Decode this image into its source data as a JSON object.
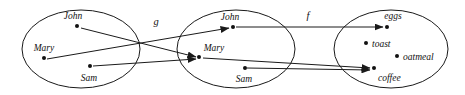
{
  "figure": {
    "background_color": "#ffffff",
    "stroke_color": "#1a1a1a",
    "width": 465,
    "height": 95
  },
  "sets": [
    {
      "id": "domain",
      "cx": 81,
      "cy": 49,
      "rx": 59,
      "ry": 39,
      "elements": [
        {
          "name": "John",
          "dot_x": 77,
          "dot_y": 26,
          "label_x": 73,
          "label_y": 19,
          "anchor": "middle"
        },
        {
          "name": "Mary",
          "dot_x": 44,
          "dot_y": 58,
          "label_x": 44,
          "label_y": 51,
          "anchor": "middle"
        },
        {
          "name": "Sam",
          "dot_x": 90,
          "dot_y": 66,
          "label_x": 89,
          "label_y": 81,
          "anchor": "middle"
        }
      ]
    },
    {
      "id": "middle",
      "cx": 236,
      "cy": 49,
      "rx": 59,
      "ry": 39,
      "elements": [
        {
          "name": "John",
          "dot_x": 233,
          "dot_y": 27,
          "label_x": 230,
          "label_y": 20,
          "anchor": "middle"
        },
        {
          "name": "Mary",
          "dot_x": 199,
          "dot_y": 57,
          "label_x": 214,
          "label_y": 51,
          "anchor": "middle"
        },
        {
          "name": "Sam",
          "dot_x": 245,
          "dot_y": 68,
          "label_x": 244,
          "label_y": 82,
          "anchor": "middle"
        }
      ]
    },
    {
      "id": "codomain",
      "cx": 391,
      "cy": 49,
      "rx": 57,
      "ry": 39,
      "elements": [
        {
          "name": "eggs",
          "dot_x": 387,
          "dot_y": 27,
          "label_x": 393,
          "label_y": 19,
          "anchor": "middle"
        },
        {
          "name": "toast",
          "dot_x": 366,
          "dot_y": 43,
          "label_x": 372,
          "label_y": 47,
          "anchor": "start"
        },
        {
          "name": "oatmeal",
          "dot_x": 397,
          "dot_y": 56,
          "label_x": 403,
          "label_y": 60,
          "anchor": "start"
        },
        {
          "name": "coffee",
          "dot_x": 374,
          "dot_y": 68,
          "label_x": 378,
          "label_y": 81,
          "anchor": "start"
        }
      ]
    }
  ],
  "maps": [
    {
      "name": "g",
      "label_x": 156,
      "label_y": 25
    },
    {
      "name": "f",
      "label_x": 308,
      "label_y": 19
    }
  ],
  "arrows": [
    {
      "from": "John(domain)",
      "to": "Mary(middle)",
      "x1": 81,
      "y1": 28,
      "x2": 196,
      "y2": 57
    },
    {
      "from": "Mary(domain)",
      "to": "John(middle)",
      "x1": 47,
      "y1": 59,
      "x2": 229,
      "y2": 28
    },
    {
      "from": "Sam(domain)",
      "to": "Mary(middle)",
      "x1": 93,
      "y1": 66,
      "x2": 196,
      "y2": 59
    },
    {
      "from": "John(middle)",
      "to": "eggs(codomain)",
      "x1": 236,
      "y1": 27,
      "x2": 383,
      "y2": 27
    },
    {
      "from": "Mary(middle)",
      "to": "coffee(codomain)",
      "x1": 203,
      "y1": 58,
      "x2": 370,
      "y2": 68
    },
    {
      "from": "Sam(middle)",
      "to": "coffee(codomain)",
      "x1": 247,
      "y1": 68,
      "x2": 370,
      "y2": 70
    }
  ]
}
